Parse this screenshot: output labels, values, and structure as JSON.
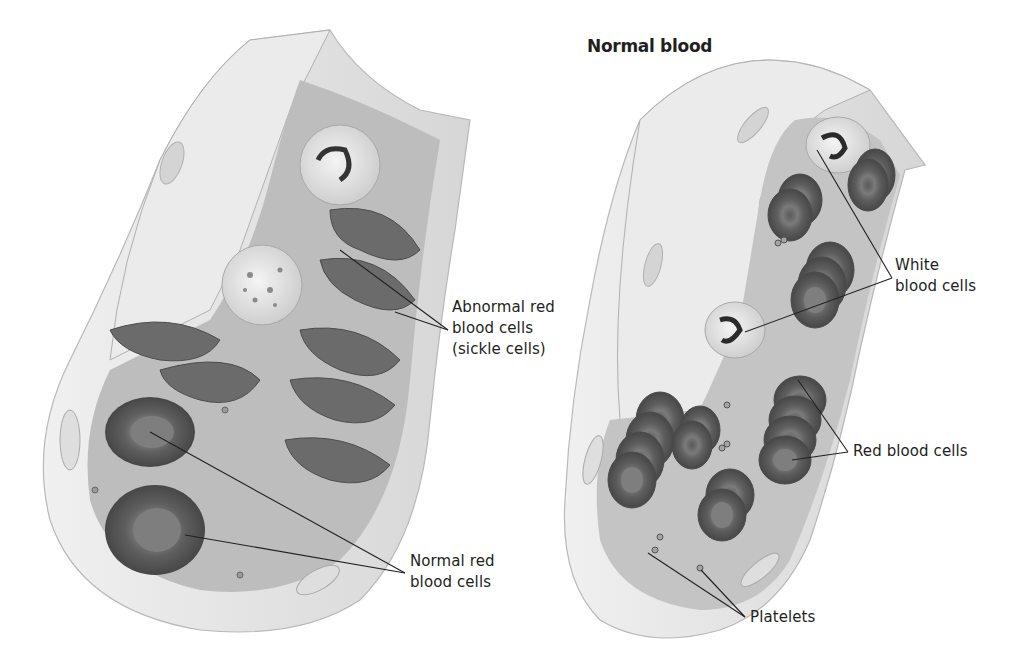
{
  "figure": {
    "panels": [
      {
        "id": "sickle",
        "title": "",
        "description": "Cut-away blood vessel with sickle-shaped abnormal red blood cells, white blood cells and some normal red blood cells"
      },
      {
        "id": "normal",
        "title": "Normal blood",
        "description": "Cut-away blood vessel with stacked normal red blood cells, white blood cells and platelets"
      }
    ],
    "labels": {
      "abnormal_rbc": {
        "line1": "Abnormal red",
        "line2": "blood cells",
        "line3": "(sickle cells)"
      },
      "normal_rbc": {
        "line1": "Normal red",
        "line2": "blood cells"
      },
      "wbc": {
        "line1": "White",
        "line2": "blood cells"
      },
      "rbc": {
        "line1": "Red blood cells"
      },
      "platelets": {
        "line1": "Platelets"
      }
    },
    "colors": {
      "vessel_wall": "#e4e4e4",
      "vessel_wall_dark": "#c8c8c8",
      "lumen": "#d2d2d2",
      "red_cell": "#6e6e6e",
      "red_cell_dark": "#4a4a4a",
      "white_cell": "#ececec",
      "leader_line": "#231f20",
      "text": "#231f20"
    }
  }
}
